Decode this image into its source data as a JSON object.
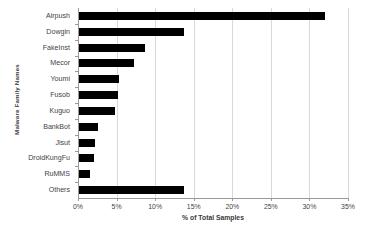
{
  "chart_data": {
    "type": "bar",
    "orientation": "horizontal",
    "title": "",
    "xlabel": "% of Total Samples",
    "ylabel": "Malware Family Names",
    "categories": [
      "Airpush",
      "Dowgin",
      "FakeInst",
      "Mecor",
      "Youmi",
      "Fusob",
      "Kuguo",
      "BankBot",
      "Jisut",
      "DroidKungFu",
      "RuMMS",
      "Others"
    ],
    "values": [
      32.0,
      13.8,
      8.7,
      7.3,
      5.3,
      5.2,
      4.8,
      2.6,
      2.2,
      2.1,
      1.6,
      13.7
    ],
    "xlim": [
      0,
      35
    ],
    "xticks": [
      0,
      5,
      10,
      15,
      20,
      25,
      30,
      35
    ],
    "xtick_labels": [
      "0%",
      "5%",
      "10%",
      "15%",
      "20%",
      "25%",
      "30%",
      "35%"
    ],
    "grid": "vertical",
    "legend": "none",
    "bar_color": "#000000",
    "gridline_color": "#d9d9d9",
    "axis_color": "#9a9a9a"
  },
  "caption": {
    "text": ""
  }
}
